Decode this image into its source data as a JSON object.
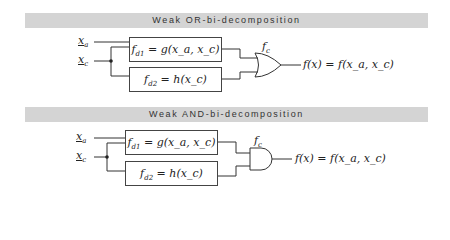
{
  "panels": [
    {
      "title": "Weak OR-bi-decomposition",
      "gate": "OR",
      "inputs": [
        {
          "var": "x",
          "sub": "a"
        },
        {
          "var": "x",
          "sub": "c"
        }
      ],
      "blocks": [
        {
          "lhs": "f",
          "lhs_sub": "d1",
          "eq": " = ",
          "fn": "g",
          "args": "(x_a, x_c)"
        },
        {
          "lhs": "f",
          "lhs_sub": "d2",
          "eq": " = ",
          "fn": "h",
          "args": "(x_c)"
        }
      ],
      "gate_label": {
        "name": "f",
        "sub": "c"
      },
      "output": "f(x) = f(x_a, x_c)"
    },
    {
      "title": "Weak AND-bi-decomposition",
      "gate": "AND",
      "inputs": [
        {
          "var": "x",
          "sub": "a"
        },
        {
          "var": "x",
          "sub": "c"
        }
      ],
      "blocks": [
        {
          "lhs": "f",
          "lhs_sub": "d1",
          "eq": " = ",
          "fn": "g",
          "args": "(x_a, x_c)"
        },
        {
          "lhs": "f",
          "lhs_sub": "d2",
          "eq": " = ",
          "fn": "h",
          "args": "(x_c)"
        }
      ],
      "gate_label": {
        "name": "f",
        "sub": "c"
      },
      "output": "f(x) = f(x_a, x_c)"
    }
  ]
}
